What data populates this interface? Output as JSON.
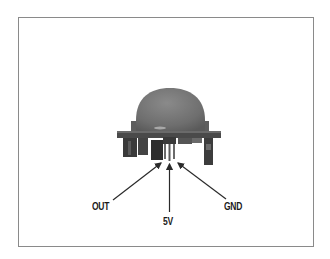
{
  "figure": {
    "pins": [
      {
        "label": "OUT"
      },
      {
        "label": "5V"
      },
      {
        "label": "GND"
      }
    ]
  },
  "colors": {
    "frame_border": "#8a8a8a",
    "dome": "#777777",
    "board": "#3a3a3a",
    "label_text": "#1a1a1a",
    "arrow": "#2a2a2a"
  }
}
